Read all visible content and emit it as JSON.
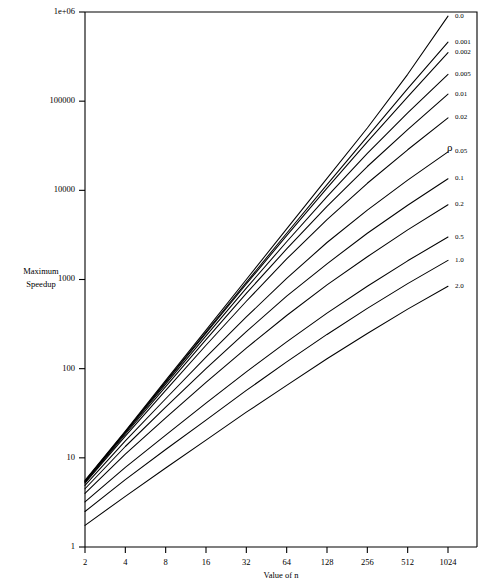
{
  "chart_data": {
    "type": "line",
    "title": "",
    "xlabel": "Value of n",
    "ylabel": "Maximum Speedup",
    "ylabel_lines": [
      "Maximum",
      "Speedup"
    ],
    "legend_title": "ρ",
    "legend_position": "right-inline-end-labels",
    "grid": false,
    "xscale": "log2",
    "yscale": "log10",
    "xlim": [
      2,
      1024
    ],
    "ylim": [
      1,
      1000000
    ],
    "x_ticks": [
      2,
      4,
      8,
      16,
      32,
      64,
      128,
      256,
      512,
      1024
    ],
    "x_tick_labels": [
      "2",
      "4",
      "8",
      "16",
      "32",
      "64",
      "128",
      "256",
      "512",
      "1024"
    ],
    "y_ticks": [
      1,
      10,
      100,
      1000,
      10000,
      100000,
      1000000
    ],
    "y_tick_labels": [
      "1",
      "10",
      "100",
      "1000",
      "10000",
      "100000",
      "1e+06"
    ],
    "x": [
      2,
      4,
      8,
      16,
      32,
      64,
      128,
      256,
      512,
      1024
    ],
    "series": [
      {
        "name": "0.0",
        "label": "0.0",
        "values": [
          5.6,
          20.0,
          74.0,
          270.0,
          1000.0,
          3700.0,
          13600.0,
          50000.0,
          200000.0,
          900000.0
        ]
      },
      {
        "name": "0.001",
        "label": "0.001",
        "values": [
          5.5,
          19.6,
          71.5,
          258.0,
          930.0,
          3300.0,
          11600.0,
          40000.0,
          138000.0,
          460000.0
        ]
      },
      {
        "name": "0.002",
        "label": "0.002",
        "values": [
          5.5,
          19.4,
          70.0,
          250.0,
          890.0,
          3100.0,
          10600.0,
          35000.0,
          112000.0,
          350000.0
        ]
      },
      {
        "name": "0.005",
        "label": "0.005",
        "values": [
          5.4,
          19.0,
          67.0,
          233.0,
          800.0,
          2650.0,
          8500.0,
          26000.0,
          74000.0,
          200000.0
        ]
      },
      {
        "name": "0.01",
        "label": "0.01",
        "values": [
          5.3,
          18.4,
          63.0,
          212.0,
          700.0,
          2200.0,
          6600.0,
          18500.0,
          48000.0,
          120000.0
        ]
      },
      {
        "name": "0.02",
        "label": "0.02",
        "values": [
          5.2,
          17.5,
          57.0,
          183.0,
          570.0,
          1700.0,
          4700.0,
          12000.0,
          28500.0,
          65000.0
        ]
      },
      {
        "name": "0.05",
        "label": "0.05",
        "values": [
          4.9,
          15.5,
          46.0,
          135.0,
          380.0,
          1030.0,
          2600.0,
          6000.0,
          13000.0,
          27000.0
        ]
      },
      {
        "name": "0.1",
        "label": "0.1",
        "values": [
          4.5,
          13.4,
          37.0,
          100.0,
          260.0,
          650.0,
          1500.0,
          3300.0,
          6800.0,
          13500.0
        ]
      },
      {
        "name": "0.2",
        "label": "0.2",
        "values": [
          4.0,
          11.0,
          28.0,
          70.0,
          170.0,
          395.0,
          870.0,
          1800.0,
          3600.0,
          6900.0
        ]
      },
      {
        "name": "0.5",
        "label": "0.5",
        "values": [
          3.2,
          7.8,
          18.0,
          41.0,
          92.0,
          200.0,
          420.0,
          840.0,
          1620.0,
          3000.0
        ]
      },
      {
        "name": "1.0",
        "label": "1.0",
        "values": [
          2.5,
          5.7,
          12.4,
          26.5,
          57.0,
          119.0,
          242.0,
          475.0,
          900.0,
          1640.0
        ]
      },
      {
        "name": "2.0",
        "label": "2.0",
        "values": [
          1.75,
          3.7,
          7.7,
          15.8,
          32.5,
          65.0,
          129.0,
          248.0,
          465.0,
          840.0
        ]
      }
    ]
  },
  "labels": {
    "x_axis_title": "Value of n",
    "y_axis_title_line1": "Maximum",
    "y_axis_title_line2": "Speedup",
    "rho_symbol": "ρ"
  },
  "colors": {
    "background": "#ffffff",
    "line": "#000000",
    "axis": "#000000"
  }
}
